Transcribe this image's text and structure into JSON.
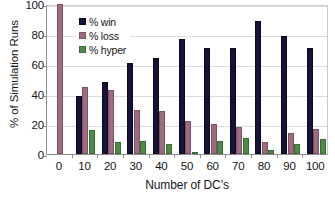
{
  "chart_data": {
    "type": "bar",
    "title": "",
    "xlabel": "Number of DC's",
    "ylabel": "% of Simulation Runs",
    "categories": [
      "0",
      "10",
      "20",
      "30",
      "40",
      "50",
      "60",
      "70",
      "80",
      "90",
      "100"
    ],
    "series": [
      {
        "name": "% win",
        "color": "#16133a",
        "values": [
          0,
          39,
          48,
          61,
          64,
          77,
          71,
          71,
          89,
          79,
          71
        ]
      },
      {
        "name": "% loss",
        "color": "#9e6b80",
        "values": [
          100,
          45,
          43,
          29.5,
          28.5,
          22,
          20,
          18,
          8,
          14,
          17
        ]
      },
      {
        "name": "% hyper",
        "color": "#4e8b46",
        "values": [
          0,
          16,
          8,
          9,
          6.5,
          1,
          8.5,
          10.5,
          3,
          7,
          10
        ]
      }
    ],
    "ylim": [
      0,
      100
    ],
    "yticks": [
      0,
      20,
      40,
      60,
      80,
      100
    ],
    "grid": true,
    "legend_position": "top-left-inside"
  }
}
